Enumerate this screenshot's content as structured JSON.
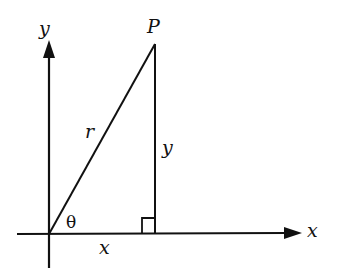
{
  "diagram": {
    "labels": {
      "y_axis": "y",
      "x_axis": "x",
      "point": "P",
      "hypotenuse": "r",
      "opposite": "y",
      "adjacent": "x",
      "angle": "θ"
    },
    "colors": {
      "line": "#111111",
      "background": "#ffffff"
    }
  }
}
